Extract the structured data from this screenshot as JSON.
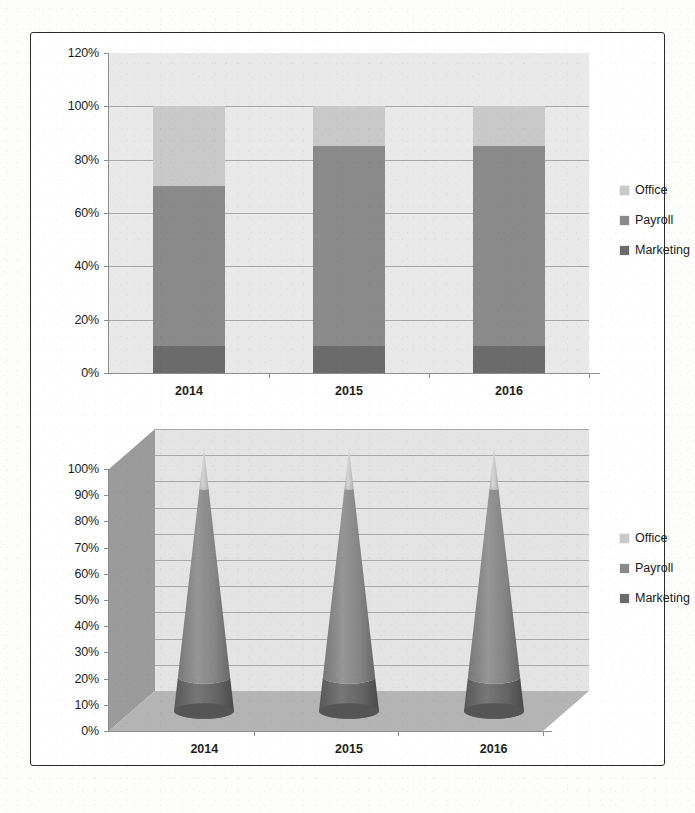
{
  "figure": {
    "background_color": "#ffffff",
    "border_color": "#2a2a2a"
  },
  "series_colors": {
    "office": "#c9c9c9",
    "payroll": "#8a8a8a",
    "marketing": "#6b6b6b",
    "plot_background": "#e9e9e9",
    "gridline": "#a8a8a8",
    "floor_3d": "#b4b4b4",
    "wall_3d": "#9b9b9b",
    "back_3d": "#e4e4e4"
  },
  "legend": {
    "items": [
      {
        "label": "Office",
        "color": "#c9c9c9",
        "swatch_icon": "legend-swatch-icon"
      },
      {
        "label": "Payroll",
        "color": "#8a8a8a",
        "swatch_icon": "legend-swatch-icon"
      },
      {
        "label": "Marketing",
        "color": "#6b6b6b",
        "swatch_icon": "legend-swatch-icon"
      }
    ]
  },
  "chart_data": [
    {
      "id": "stacked-column-100",
      "type": "bar",
      "stacked": true,
      "title": "",
      "subtitle": "",
      "xlabel": "",
      "ylabel": "",
      "categories": [
        "2014",
        "2015",
        "2016"
      ],
      "ylim": [
        0,
        120
      ],
      "ytick_values": [
        0,
        20,
        40,
        60,
        80,
        100,
        120
      ],
      "ytick_labels": [
        "0%",
        "20%",
        "40%",
        "60%",
        "80%",
        "100%",
        "120%"
      ],
      "grid": true,
      "grid_axis": "y",
      "legend_position": "right",
      "series": [
        {
          "name": "Marketing",
          "color": "#6b6b6b",
          "values": [
            10,
            10,
            10
          ]
        },
        {
          "name": "Payroll",
          "color": "#8a8a8a",
          "values": [
            60,
            75,
            75
          ]
        },
        {
          "name": "Office",
          "color": "#c9c9c9",
          "values": [
            30,
            15,
            15
          ]
        }
      ],
      "series_cumulative_tops": {
        "Marketing": [
          10,
          10,
          10
        ],
        "Payroll": [
          70,
          85,
          85
        ],
        "Office": [
          100,
          100,
          100
        ]
      }
    },
    {
      "id": "stacked-cone-3d-100",
      "type": "bar",
      "stacked": true,
      "shape": "cone",
      "projection": "3d",
      "title": "",
      "subtitle": "",
      "xlabel": "",
      "ylabel": "",
      "categories": [
        "2014",
        "2015",
        "2016"
      ],
      "ylim": [
        0,
        100
      ],
      "ytick_values": [
        0,
        10,
        20,
        30,
        40,
        50,
        60,
        70,
        80,
        90,
        100
      ],
      "ytick_labels": [
        "0%",
        "10%",
        "20%",
        "30%",
        "40%",
        "50%",
        "60%",
        "70%",
        "80%",
        "90%",
        "100%"
      ],
      "grid": true,
      "grid_axis": "y",
      "legend_position": "right",
      "series": [
        {
          "name": "Marketing",
          "color": "#6b6b6b",
          "values": [
            13,
            13,
            13
          ]
        },
        {
          "name": "Payroll",
          "color": "#8a8a8a",
          "values": [
            72,
            72,
            72
          ]
        },
        {
          "name": "Office",
          "color": "#c9c9c9",
          "values": [
            15,
            15,
            15
          ]
        }
      ],
      "series_cumulative_tops": {
        "Marketing": [
          13,
          13,
          13
        ],
        "Payroll": [
          85,
          85,
          85
        ],
        "Office": [
          100,
          100,
          100
        ]
      }
    }
  ]
}
